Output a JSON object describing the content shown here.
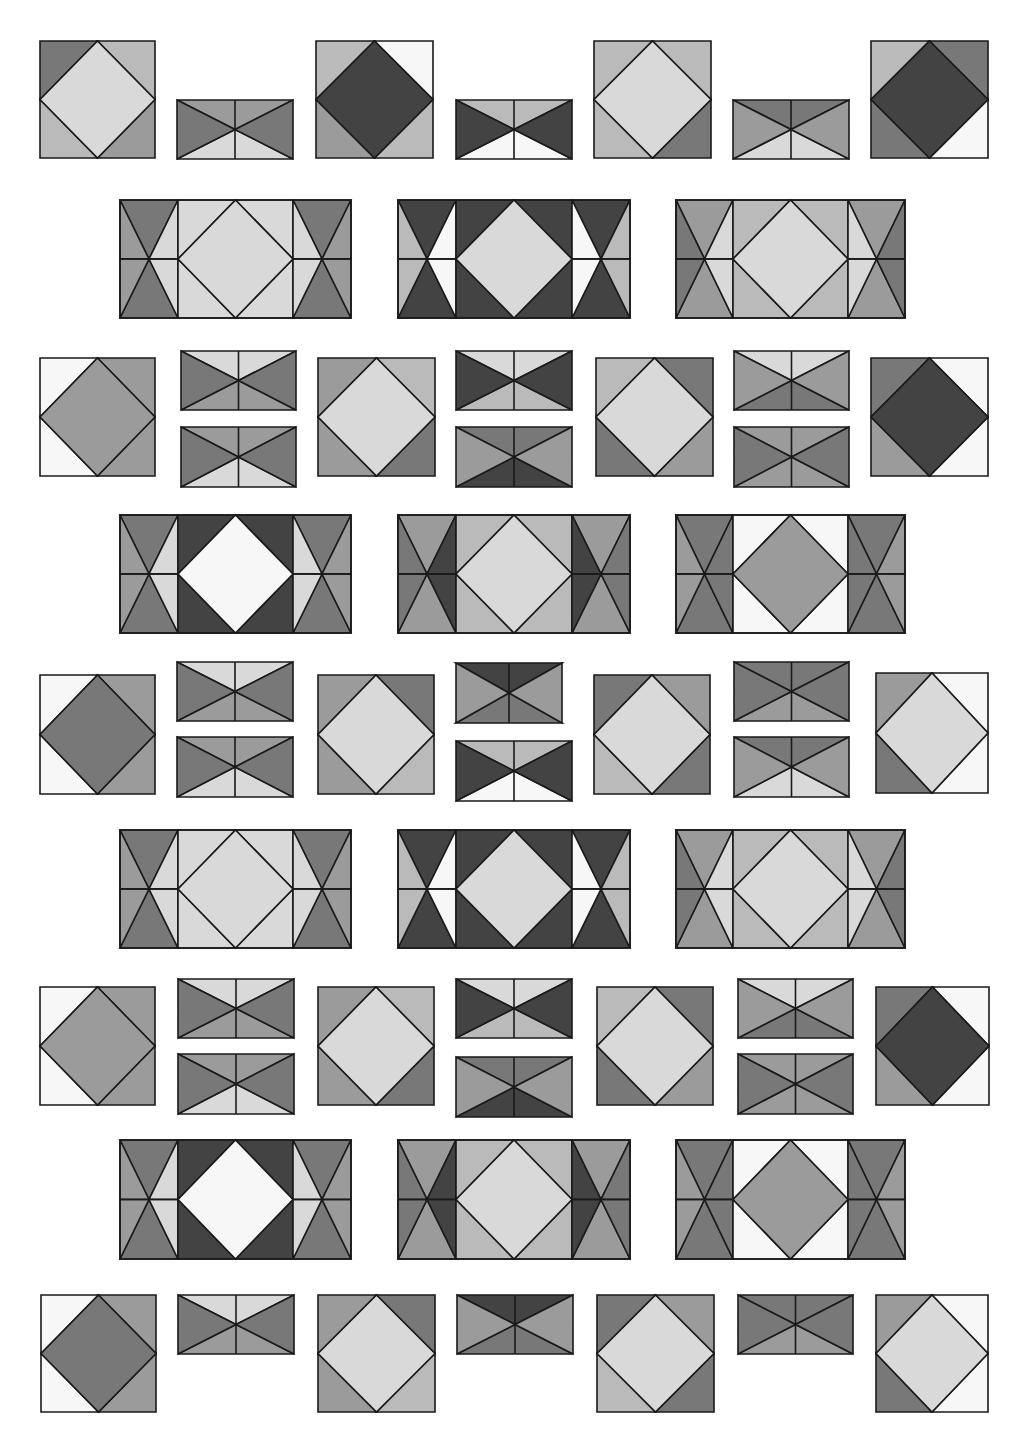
{
  "canvas": {
    "width": 1023,
    "height": 1455,
    "background": "#ffffff"
  },
  "palette": {
    "W": "#f7f7f7",
    "L": "#d9d9d9",
    "M1": "#bababa",
    "M": "#9b9b9b",
    "D": "#787878",
    "K": "#434343"
  },
  "pieces": [
    {
      "type": "square",
      "x": 40,
      "y": 41,
      "w": 115,
      "h": 117,
      "c": {
        "tl": "D",
        "tr": "M1",
        "bl": "M1",
        "br": "M",
        "center": "L"
      }
    },
    {
      "type": "hbow",
      "x": 177,
      "y": 100,
      "w": 116,
      "h": 59,
      "c": {
        "t": "M",
        "l": "D",
        "r": "D",
        "b": "L"
      }
    },
    {
      "type": "square",
      "x": 316,
      "y": 41,
      "w": 117,
      "h": 117,
      "c": {
        "tl": "M1",
        "tr": "W",
        "bl": "M",
        "br": "M1",
        "center": "K"
      }
    },
    {
      "type": "hbow",
      "x": 456,
      "y": 100,
      "w": 116,
      "h": 59,
      "c": {
        "t": "M1",
        "l": "K",
        "r": "K",
        "b": "W"
      }
    },
    {
      "type": "square",
      "x": 594,
      "y": 41,
      "w": 117,
      "h": 117,
      "c": {
        "tl": "M1",
        "tr": "M1",
        "bl": "M1",
        "br": "D",
        "center": "L"
      }
    },
    {
      "type": "hbow",
      "x": 733,
      "y": 100,
      "w": 116,
      "h": 59,
      "c": {
        "t": "D",
        "l": "M",
        "r": "M",
        "b": "L"
      }
    },
    {
      "type": "square",
      "x": 871,
      "y": 41,
      "w": 117,
      "h": 117,
      "c": {
        "tl": "M1",
        "tr": "D",
        "bl": "D",
        "br": "W",
        "center": "K"
      }
    },
    {
      "type": "block",
      "x": 120,
      "y": 200,
      "w": 231,
      "h": 118,
      "c": {
        "side_tb": "D",
        "side_out": "M",
        "side_in": "L",
        "corner": "L",
        "center": "L"
      }
    },
    {
      "type": "block",
      "x": 398,
      "y": 200,
      "w": 232,
      "h": 118,
      "c": {
        "side_tb": "K",
        "side_out": "M1",
        "side_in": "W",
        "corner": "K",
        "center": "L"
      }
    },
    {
      "type": "block",
      "x": 676,
      "y": 200,
      "w": 229,
      "h": 118,
      "c": {
        "side_tb": "M",
        "side_out": "D",
        "side_in": "L",
        "corner": "M1",
        "center": "L"
      }
    },
    {
      "type": "square",
      "x": 40,
      "y": 358,
      "w": 115,
      "h": 118,
      "c": {
        "tl": "W",
        "tr": "M",
        "bl": "W",
        "br": "M",
        "center": "M"
      }
    },
    {
      "type": "hbow",
      "x": 181,
      "y": 351,
      "w": 115,
      "h": 59,
      "c": {
        "t": "L",
        "l": "D",
        "r": "D",
        "b": "M"
      }
    },
    {
      "type": "hbow",
      "x": 181,
      "y": 427,
      "w": 115,
      "h": 60,
      "c": {
        "t": "M",
        "l": "D",
        "r": "D",
        "b": "L"
      }
    },
    {
      "type": "square",
      "x": 318,
      "y": 358,
      "w": 117,
      "h": 118,
      "c": {
        "tl": "M",
        "tr": "M1",
        "bl": "M",
        "br": "D",
        "center": "L"
      }
    },
    {
      "type": "hbow",
      "x": 456,
      "y": 351,
      "w": 116,
      "h": 59,
      "c": {
        "t": "L",
        "l": "K",
        "r": "K",
        "b": "M1"
      }
    },
    {
      "type": "hbow",
      "x": 456,
      "y": 427,
      "w": 116,
      "h": 60,
      "c": {
        "t": "D",
        "l": "M",
        "r": "M",
        "b": "K"
      }
    },
    {
      "type": "square",
      "x": 596,
      "y": 358,
      "w": 117,
      "h": 118,
      "c": {
        "tl": "M1",
        "tr": "D",
        "bl": "D",
        "br": "M",
        "center": "L"
      }
    },
    {
      "type": "hbow",
      "x": 734,
      "y": 351,
      "w": 115,
      "h": 59,
      "c": {
        "t": "L",
        "l": "M",
        "r": "M",
        "b": "D"
      }
    },
    {
      "type": "hbow",
      "x": 734,
      "y": 427,
      "w": 115,
      "h": 60,
      "c": {
        "t": "M",
        "l": "D",
        "r": "D",
        "b": "M"
      }
    },
    {
      "type": "square",
      "x": 871,
      "y": 358,
      "w": 117,
      "h": 118,
      "c": {
        "tl": "D",
        "tr": "W",
        "bl": "M",
        "br": "W",
        "center": "K"
      }
    },
    {
      "type": "block",
      "x": 120,
      "y": 515,
      "w": 231,
      "h": 118,
      "c": {
        "side_tb": "D",
        "side_out": "M",
        "side_in": "L",
        "corner": "K",
        "center": "W"
      }
    },
    {
      "type": "block",
      "x": 398,
      "y": 515,
      "w": 232,
      "h": 118,
      "c": {
        "side_tb": "M",
        "side_out": "D",
        "side_in": "K",
        "corner": "M1",
        "center": "L"
      }
    },
    {
      "type": "block",
      "x": 676,
      "y": 515,
      "w": 229,
      "h": 118,
      "c": {
        "side_tb": "D",
        "side_out": "M",
        "side_in": "D",
        "corner": "W",
        "center": "M"
      }
    },
    {
      "type": "square",
      "x": 40,
      "y": 675,
      "w": 115,
      "h": 119,
      "c": {
        "tl": "W",
        "tr": "M",
        "bl": "W",
        "br": "M",
        "center": "D"
      }
    },
    {
      "type": "hbow",
      "x": 177,
      "y": 662,
      "w": 116,
      "h": 59,
      "c": {
        "t": "L",
        "l": "D",
        "r": "D",
        "b": "M"
      }
    },
    {
      "type": "hbow",
      "x": 177,
      "y": 737,
      "w": 116,
      "h": 60,
      "c": {
        "t": "M",
        "l": "D",
        "r": "D",
        "b": "L"
      }
    },
    {
      "type": "square",
      "x": 318,
      "y": 675,
      "w": 116,
      "h": 119,
      "c": {
        "tl": "M",
        "tr": "D",
        "bl": "M",
        "br": "M1",
        "center": "L"
      }
    },
    {
      "type": "hbow",
      "x": 456,
      "y": 663,
      "w": 106,
      "h": 60,
      "c": {
        "t": "K",
        "l": "M",
        "r": "M",
        "b": "D"
      }
    },
    {
      "type": "hbow",
      "x": 456,
      "y": 741,
      "w": 116,
      "h": 60,
      "c": {
        "t": "M1",
        "l": "K",
        "r": "K",
        "b": "W"
      }
    },
    {
      "type": "square",
      "x": 594,
      "y": 675,
      "w": 116,
      "h": 119,
      "c": {
        "tl": "D",
        "tr": "M",
        "bl": "M1",
        "br": "D",
        "center": "L"
      }
    },
    {
      "type": "hbow",
      "x": 734,
      "y": 662,
      "w": 115,
      "h": 59,
      "c": {
        "t": "D",
        "l": "D",
        "r": "D",
        "b": "M"
      }
    },
    {
      "type": "hbow",
      "x": 734,
      "y": 737,
      "w": 115,
      "h": 60,
      "c": {
        "t": "D",
        "l": "M",
        "r": "M",
        "b": "L"
      }
    },
    {
      "type": "square",
      "x": 876,
      "y": 673,
      "w": 112,
      "h": 120,
      "c": {
        "tl": "M",
        "tr": "W",
        "bl": "D",
        "br": "W",
        "center": "L"
      }
    },
    {
      "type": "block",
      "x": 120,
      "y": 830,
      "w": 231,
      "h": 118,
      "c": {
        "side_tb": "D",
        "side_out": "M",
        "side_in": "L",
        "corner": "L",
        "center": "L"
      }
    },
    {
      "type": "block",
      "x": 398,
      "y": 830,
      "w": 232,
      "h": 118,
      "c": {
        "side_tb": "K",
        "side_out": "M1",
        "side_in": "W",
        "corner": "K",
        "center": "L"
      }
    },
    {
      "type": "block",
      "x": 676,
      "y": 830,
      "w": 229,
      "h": 118,
      "c": {
        "side_tb": "M",
        "side_out": "D",
        "side_in": "L",
        "corner": "M1",
        "center": "L"
      }
    },
    {
      "type": "square",
      "x": 40,
      "y": 987,
      "w": 115,
      "h": 118,
      "c": {
        "tl": "W",
        "tr": "M",
        "bl": "W",
        "br": "M",
        "center": "M"
      }
    },
    {
      "type": "hbow",
      "x": 178,
      "y": 979,
      "w": 116,
      "h": 59,
      "c": {
        "t": "L",
        "l": "D",
        "r": "D",
        "b": "M"
      }
    },
    {
      "type": "hbow",
      "x": 178,
      "y": 1054,
      "w": 116,
      "h": 60,
      "c": {
        "t": "M",
        "l": "D",
        "r": "D",
        "b": "L"
      }
    },
    {
      "type": "square",
      "x": 318,
      "y": 987,
      "w": 116,
      "h": 118,
      "c": {
        "tl": "M",
        "tr": "M1",
        "bl": "M",
        "br": "D",
        "center": "L"
      }
    },
    {
      "type": "hbow",
      "x": 456,
      "y": 979,
      "w": 116,
      "h": 59,
      "c": {
        "t": "L",
        "l": "K",
        "r": "K",
        "b": "M1"
      }
    },
    {
      "type": "hbow",
      "x": 456,
      "y": 1057,
      "w": 116,
      "h": 60,
      "c": {
        "t": "D",
        "l": "M",
        "r": "M",
        "b": "K"
      }
    },
    {
      "type": "square",
      "x": 597,
      "y": 987,
      "w": 116,
      "h": 118,
      "c": {
        "tl": "M1",
        "tr": "D",
        "bl": "D",
        "br": "M",
        "center": "L"
      }
    },
    {
      "type": "hbow",
      "x": 738,
      "y": 979,
      "w": 115,
      "h": 59,
      "c": {
        "t": "L",
        "l": "M",
        "r": "M",
        "b": "D"
      }
    },
    {
      "type": "hbow",
      "x": 738,
      "y": 1054,
      "w": 115,
      "h": 60,
      "c": {
        "t": "M",
        "l": "D",
        "r": "D",
        "b": "M"
      }
    },
    {
      "type": "square",
      "x": 876,
      "y": 987,
      "w": 113,
      "h": 118,
      "c": {
        "tl": "D",
        "tr": "W",
        "bl": "M",
        "br": "W",
        "center": "K"
      }
    },
    {
      "type": "block",
      "x": 120,
      "y": 1140,
      "w": 231,
      "h": 119,
      "c": {
        "side_tb": "D",
        "side_out": "M",
        "side_in": "L",
        "corner": "K",
        "center": "W"
      }
    },
    {
      "type": "block",
      "x": 398,
      "y": 1140,
      "w": 232,
      "h": 119,
      "c": {
        "side_tb": "M",
        "side_out": "D",
        "side_in": "K",
        "corner": "M1",
        "center": "L"
      }
    },
    {
      "type": "block",
      "x": 676,
      "y": 1140,
      "w": 229,
      "h": 119,
      "c": {
        "side_tb": "D",
        "side_out": "M",
        "side_in": "D",
        "corner": "W",
        "center": "M"
      }
    },
    {
      "type": "square",
      "x": 41,
      "y": 1295,
      "w": 115,
      "h": 117,
      "c": {
        "tl": "W",
        "tr": "M",
        "bl": "W",
        "br": "M",
        "center": "D"
      }
    },
    {
      "type": "hbow",
      "x": 178,
      "y": 1295,
      "w": 116,
      "h": 59,
      "c": {
        "t": "L",
        "l": "D",
        "r": "D",
        "b": "M"
      }
    },
    {
      "type": "square",
      "x": 318,
      "y": 1295,
      "w": 117,
      "h": 117,
      "c": {
        "tl": "M",
        "tr": "D",
        "bl": "M",
        "br": "M1",
        "center": "L"
      }
    },
    {
      "type": "hbow",
      "x": 457,
      "y": 1295,
      "w": 116,
      "h": 59,
      "c": {
        "t": "K",
        "l": "M",
        "r": "M",
        "b": "D"
      }
    },
    {
      "type": "square",
      "x": 597,
      "y": 1295,
      "w": 117,
      "h": 117,
      "c": {
        "tl": "D",
        "tr": "M",
        "bl": "M1",
        "br": "D",
        "center": "L"
      }
    },
    {
      "type": "hbow",
      "x": 738,
      "y": 1295,
      "w": 115,
      "h": 59,
      "c": {
        "t": "D",
        "l": "D",
        "r": "D",
        "b": "M"
      }
    },
    {
      "type": "square",
      "x": 876,
      "y": 1295,
      "w": 112,
      "h": 117,
      "c": {
        "tl": "M",
        "tr": "W",
        "bl": "D",
        "br": "W",
        "center": "L"
      }
    }
  ]
}
